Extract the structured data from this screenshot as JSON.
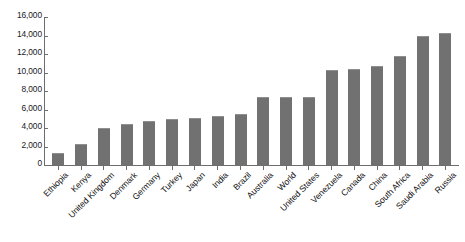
{
  "chart_data": {
    "type": "bar",
    "title": "",
    "subtitle": "",
    "xlabel": "",
    "ylabel": "",
    "ylim": [
      0,
      16000
    ],
    "ytick_step": 2000,
    "grid": false,
    "legend": false,
    "bar_color": "#717171",
    "axis_color": "#6e6e6e",
    "ytick_labels": [
      "16,000",
      "14,000",
      "12,000",
      "10,000",
      "8,000",
      "6,000",
      "4,000",
      "2,000",
      "0"
    ],
    "ytick_values": [
      16000,
      14000,
      12000,
      10000,
      8000,
      6000,
      4000,
      2000,
      0
    ],
    "categories": [
      "Ethiopia",
      "Kenya",
      "United Kingdom",
      "Denmark",
      "Germany",
      "Turkey",
      "Japan",
      "India",
      "Brazil",
      "Australia",
      "World",
      "United States",
      "Venezuela",
      "Canada",
      "China",
      "South Africa",
      "Saudi Arabia",
      "Russia"
    ],
    "values": [
      1300,
      2300,
      4000,
      4400,
      4800,
      5000,
      5100,
      5300,
      5500,
      7300,
      7300,
      7300,
      10300,
      10400,
      10700,
      11800,
      13900,
      14300
    ]
  }
}
